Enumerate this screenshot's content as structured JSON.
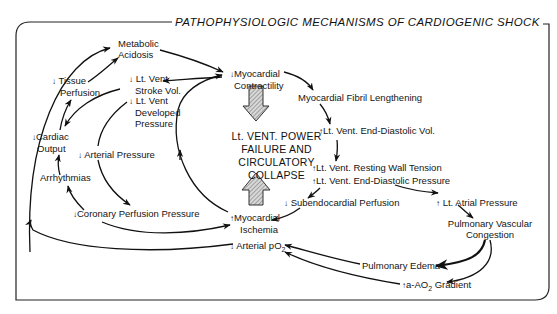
{
  "title": "PATHOPHYSIOLOGIC MECHANISMS OF CARDIOGENIC SHOCK",
  "center": {
    "line1": "Lt. VENT. POWER",
    "line2": "FAILURE AND",
    "line3": "CIRCULATORY COLLAPSE"
  },
  "nodes": {
    "metabolic_acidosis": {
      "line1": "Metabolic",
      "line2": "Acidosis"
    },
    "tissue_perfusion": {
      "arrow": "↓",
      "line1": "Tissue",
      "line2": "Perfusion"
    },
    "stroke_vol": {
      "arrow": "↓",
      "line1": "Lt. Vent",
      "line2": "Stroke Vol."
    },
    "developed_pressure": {
      "arrow": "↓",
      "line1": "Lt. Vent",
      "line2": "Developed",
      "line3": "Pressure"
    },
    "cardiac_output": {
      "arrow": "↓",
      "line1": "Cardiac",
      "line2": "Output"
    },
    "arterial_pressure": {
      "arrow": "↓",
      "text": "Arterial Pressure"
    },
    "arrhythmias": {
      "text": "Arrhythmias"
    },
    "coronary_perfusion": {
      "arrow": "↓",
      "text": "Coronary Perfusion Pressure"
    },
    "myocardial_contractility": {
      "arrow": "↓",
      "line1": "Myocardial",
      "line2": "Contractility"
    },
    "fibril_lengthening": {
      "text": "Myocardial Fibril Lengthening"
    },
    "edv": {
      "arrow": "↑",
      "text": "Lt. Vent. End-Diastolic Vol."
    },
    "wall_tension": {
      "arrow": "↑",
      "text": "Lt. Vent. Resting Wall Tension"
    },
    "edp": {
      "arrow": "↑",
      "text": "Lt. Vent. End-Diastolic Pressure"
    },
    "subendocardial": {
      "arrow": "↓",
      "text": "Subendocardial Perfusion"
    },
    "ischemia": {
      "arrow": "↑",
      "line1": "Myocardial",
      "line2": "Ischemia"
    },
    "atrial_pressure": {
      "arrow": "↑",
      "text": "Lt. Atrial Pressure"
    },
    "pulm_congestion": {
      "line1": "Pulmonary Vascular",
      "line2": "Congestion"
    },
    "arterial_po2": {
      "arrow": "↓",
      "text": "Arterial pO",
      "sub": "2"
    },
    "pulm_edema": {
      "text": "Pulmonary Edema"
    },
    "gradient": {
      "arrow": "↑",
      "text": "a-AO",
      "sub": "2",
      "text2": " Gradient"
    }
  },
  "colors": {
    "stroke": "#111111",
    "hatch_fill": "#bdbdbd",
    "background": "#ffffff"
  }
}
